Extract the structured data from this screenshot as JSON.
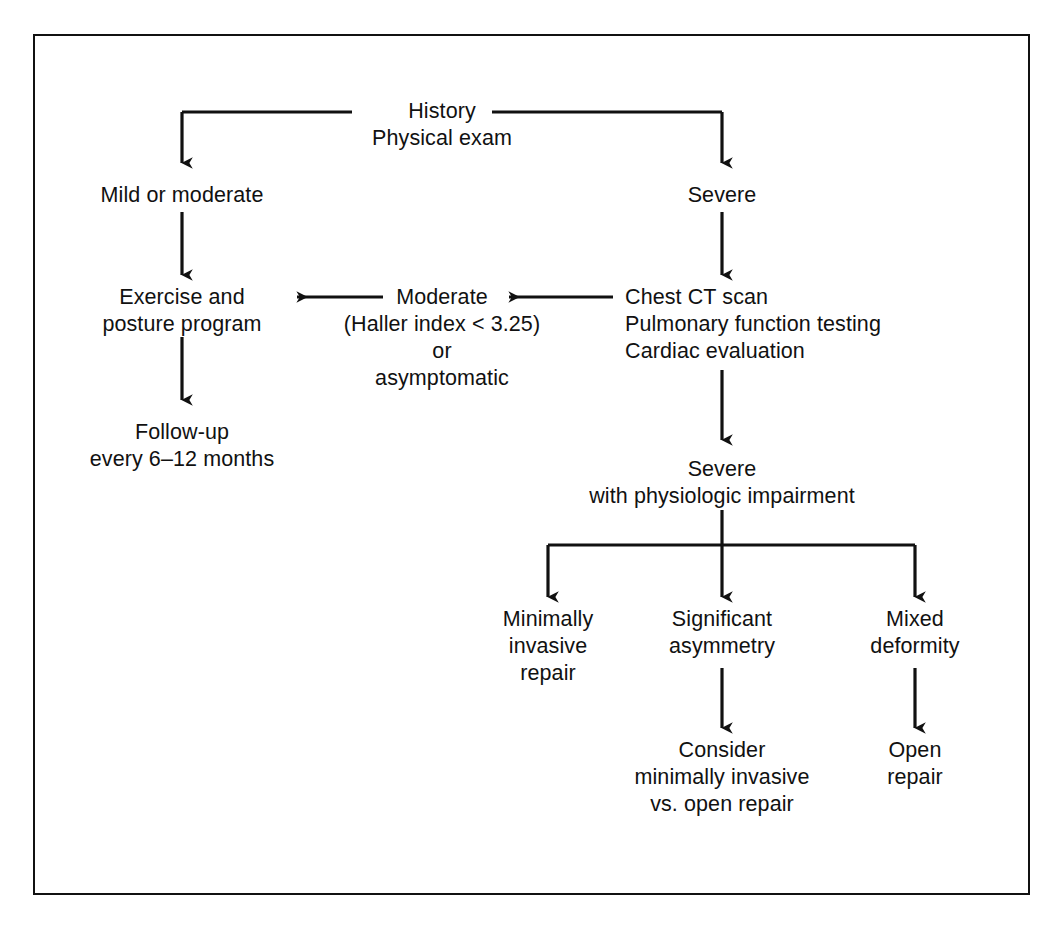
{
  "figure": {
    "type": "clinical-decision-flowchart",
    "border_color": "#111111",
    "text_color": "#111111",
    "background": "#ffffff"
  },
  "nodes": {
    "root": "History\nPhysical exam",
    "mild_moderate": "Mild or moderate",
    "severe": "Severe",
    "exercise": "Exercise and\nposture program",
    "moderate_haller": "Moderate\n(Haller index < 3.25)\nor\nasymptomatic",
    "workup": "Chest CT scan\nPulmonary function testing\nCardiac evaluation",
    "followup": "Follow-up\nevery 6–12 months",
    "severe_impair": "Severe\nwith physiologic impairment",
    "minimally_invasive": "Minimally\ninvasive\nrepair",
    "significant_asymmetry": "Significant\nasymmetry",
    "mixed_deformity": "Mixed\ndeformity",
    "consider": "Consider\nminimally invasive\nvs. open repair",
    "open_repair": "Open\nrepair"
  },
  "edges": [
    {
      "from": "root",
      "to": "mild_moderate",
      "style": "elbow-down-left"
    },
    {
      "from": "root",
      "to": "severe",
      "style": "elbow-down-right"
    },
    {
      "from": "mild_moderate",
      "to": "exercise",
      "style": "down"
    },
    {
      "from": "severe",
      "to": "workup",
      "style": "down"
    },
    {
      "from": "workup",
      "to": "moderate_haller",
      "style": "left"
    },
    {
      "from": "moderate_haller",
      "to": "exercise",
      "style": "left"
    },
    {
      "from": "exercise",
      "to": "followup",
      "style": "down"
    },
    {
      "from": "workup",
      "to": "severe_impair",
      "style": "down"
    },
    {
      "from": "severe_impair",
      "to": "minimally_invasive",
      "style": "split-down-left"
    },
    {
      "from": "severe_impair",
      "to": "significant_asymmetry",
      "style": "split-down-center"
    },
    {
      "from": "severe_impair",
      "to": "mixed_deformity",
      "style": "split-down-right"
    },
    {
      "from": "significant_asymmetry",
      "to": "consider",
      "style": "down"
    },
    {
      "from": "mixed_deformity",
      "to": "open_repair",
      "style": "down"
    }
  ]
}
